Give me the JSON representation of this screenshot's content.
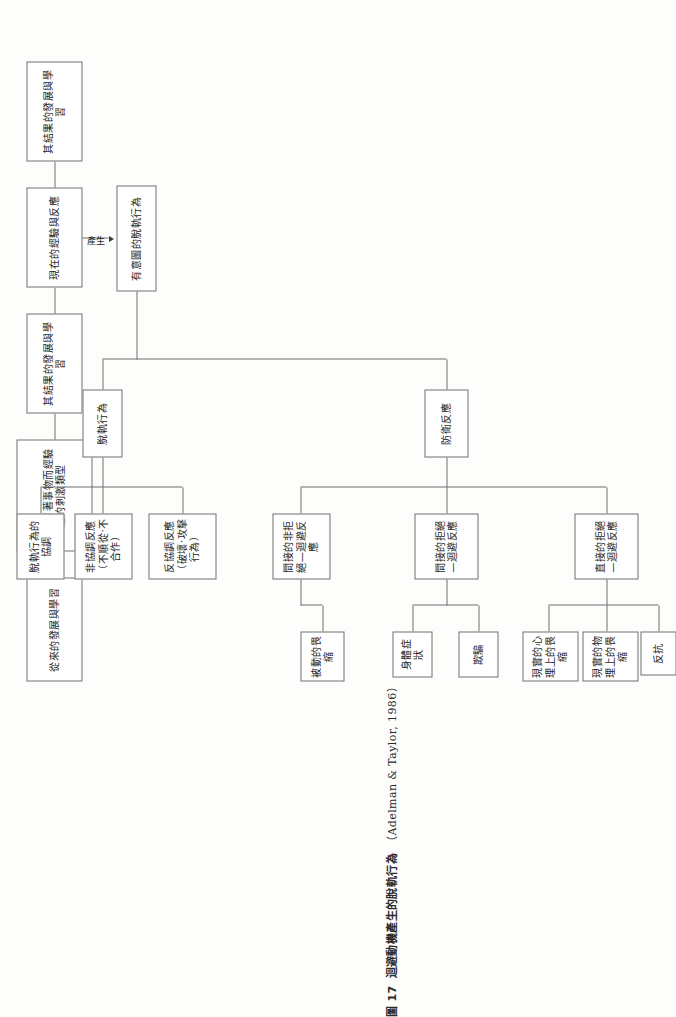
{
  "figure": {
    "number": "圖 17",
    "title": "迴避動機產生的脫軌行為",
    "citation": "（Adelman & Taylor, 1986）"
  },
  "edge_labels": {
    "produces": "產生"
  },
  "nodes": {
    "past_dev": "從來的發展與學習",
    "stimulus_type": "當做有著事物而經驗過的刺激類型",
    "past_result": "其結果的發展與學習",
    "present_exp": "現在的經驗與反應",
    "present_result": "其結果的發展與學習",
    "intentional": "有意圖的脫軌行為",
    "deviant_behavior": "脫軌行為",
    "defensive_reaction": "防衛反應",
    "counter_coop": "反協調反應（破壞‧攻擊行為）",
    "non_coop": "非協調反應（不順從‧不合作）",
    "coordination": "脫軌行為的協調",
    "indirect_nonreject": "間接的非拒絕—迴避反應",
    "passive_withdraw": "被動的畏縮",
    "indirect_reject": "間接的拒絕—迴避反應",
    "deception": "欺騙",
    "somatic": "身體症狀",
    "direct_reject": "直接的拒絕—迴避反應",
    "resist": "反抗",
    "physical_withdraw": "現實的物理上的畏縮",
    "psych_withdraw": "現實的心理上的畏縮"
  },
  "colors": {
    "stroke": "#6e6e6e",
    "text": "#1d1d1d",
    "background": "#fdfdfb"
  }
}
